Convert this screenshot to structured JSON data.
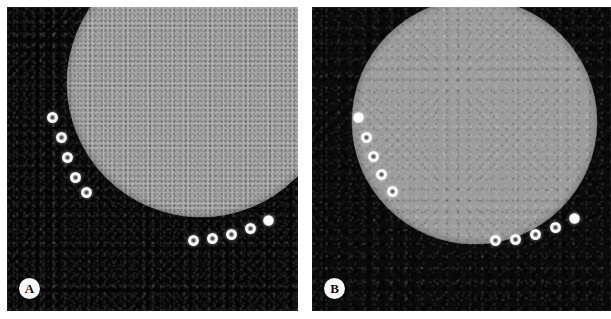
{
  "figure": {
    "background_color": "#ffffff",
    "width": 611,
    "height": 319,
    "panel_count": 2
  },
  "panels": [
    {
      "id": "panel-a",
      "letter": "A",
      "x": 7,
      "y": 7,
      "width": 291,
      "height": 304,
      "background_color": "#090909",
      "noise_level": "high",
      "disc": {
        "name": "phantom-disc",
        "fill_color": "#9d9d9d",
        "left": 60,
        "top": -58,
        "size": 268,
        "texture": "fine-speckle"
      },
      "markers": [
        {
          "x": 45,
          "y": 110,
          "style": "ring"
        },
        {
          "x": 54,
          "y": 130,
          "style": "ring"
        },
        {
          "x": 60,
          "y": 150,
          "style": "ring"
        },
        {
          "x": 68,
          "y": 170,
          "style": "ring"
        },
        {
          "x": 79,
          "y": 185,
          "style": "ring"
        },
        {
          "x": 186,
          "y": 233,
          "style": "ring"
        },
        {
          "x": 205,
          "y": 231,
          "style": "ring"
        },
        {
          "x": 224,
          "y": 227,
          "style": "ring"
        },
        {
          "x": 243,
          "y": 221,
          "style": "ring"
        },
        {
          "x": 261,
          "y": 213,
          "style": "solid"
        }
      ]
    },
    {
      "id": "panel-b",
      "letter": "B",
      "x": 312,
      "y": 7,
      "width": 299,
      "height": 304,
      "background_color": "#0b0b0b",
      "noise_level": "low",
      "disc": {
        "name": "phantom-disc",
        "fill_color": "#9c9c9c",
        "left": 40,
        "top": -8,
        "size": 245,
        "texture": "smooth-blurred"
      },
      "markers": [
        {
          "x": 46,
          "y": 110,
          "style": "solid"
        },
        {
          "x": 54,
          "y": 130,
          "style": "ring"
        },
        {
          "x": 61,
          "y": 149,
          "style": "ring"
        },
        {
          "x": 69,
          "y": 167,
          "style": "ring"
        },
        {
          "x": 80,
          "y": 184,
          "style": "ring"
        },
        {
          "x": 183,
          "y": 233,
          "style": "ring"
        },
        {
          "x": 203,
          "y": 232,
          "style": "ring"
        },
        {
          "x": 223,
          "y": 227,
          "style": "ring"
        },
        {
          "x": 243,
          "y": 220,
          "style": "ring"
        },
        {
          "x": 262,
          "y": 211,
          "style": "solid"
        }
      ]
    }
  ],
  "labels": {
    "panel_a_letter": "A",
    "panel_b_letter": "B"
  },
  "colors": {
    "page_background": "#ffffff",
    "soft_tissue_dark": "#090909",
    "disc_gray": "#9d9d9d",
    "marker_bright": "#ffffff",
    "label_badge_background": "#f7f7f7",
    "label_badge_text": "#101010"
  }
}
